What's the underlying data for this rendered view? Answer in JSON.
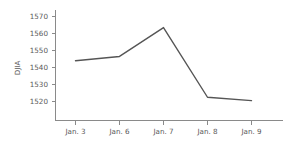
{
  "chart_data": {
    "type": "line",
    "title": "",
    "subtitle": "",
    "xlabel": "",
    "ylabel": "DJIA",
    "categories": [
      "Jan. 3",
      "Jan. 6",
      "Jan. 7",
      "Jan. 8",
      "Jan. 9"
    ],
    "values": [
      1544,
      1546.5,
      1563.5,
      1522.5,
      1520.5
    ],
    "series": [
      {
        "name": "DJIA",
        "values": [
          1544,
          1546.5,
          1563.5,
          1522.5,
          1520.5
        ]
      }
    ],
    "ylim": [
      1513,
      1573
    ],
    "y_ticks": [
      1520,
      1530,
      1540,
      1550,
      1560,
      1570
    ],
    "y_tick_labels": [
      "1520",
      "1530",
      "1540",
      "1550",
      "1560",
      "1570"
    ],
    "x_tick_labels": [
      "Jan. 3",
      "Jan. 6",
      "Jan. 7",
      "Jan. 8",
      "Jan. 9"
    ],
    "grid": false,
    "legend": false,
    "legend_position": "none",
    "line_color": "#555555",
    "axis_color": "#8a8a8a",
    "text_color": "#5a5a5a",
    "background_color": "#ffffff",
    "annotations": []
  }
}
